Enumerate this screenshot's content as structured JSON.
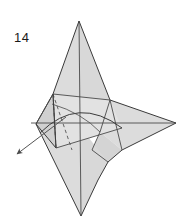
{
  "figure": {
    "kind": "origami-folding-diagram",
    "step_number": "14",
    "caption": "",
    "paper_fill_color": "#dcdcdc",
    "paper_fill_light": "#e4e4e4",
    "paper_fill_dark": "#cfcfcf",
    "outline_color": "#3a3a3a",
    "crease_color": "#4a4a4a",
    "hidden_crease_color": "#555555",
    "arrow_color": "#555555",
    "background_color": "#ffffff",
    "annotations": {
      "arrow": {
        "name": "pull-out-arrow",
        "direction": "down-left",
        "style": "solid-line-with-filled-head",
        "start": "65,118",
        "end": "13,157",
        "meaning": "pull flap out to the lower left"
      },
      "dashed_line": {
        "name": "hidden-edge",
        "style": "dashed",
        "meaning": "edge hidden behind the paper"
      },
      "curved_line": {
        "name": "curved-crease",
        "style": "solid-arc",
        "meaning": "curved folded edge across the middle"
      }
    },
    "shape_summary": {
      "top_point": "79,21",
      "right_point": "176,123",
      "bottom_point": "81,216",
      "left_point": "36,124",
      "points_count": 4
    }
  }
}
